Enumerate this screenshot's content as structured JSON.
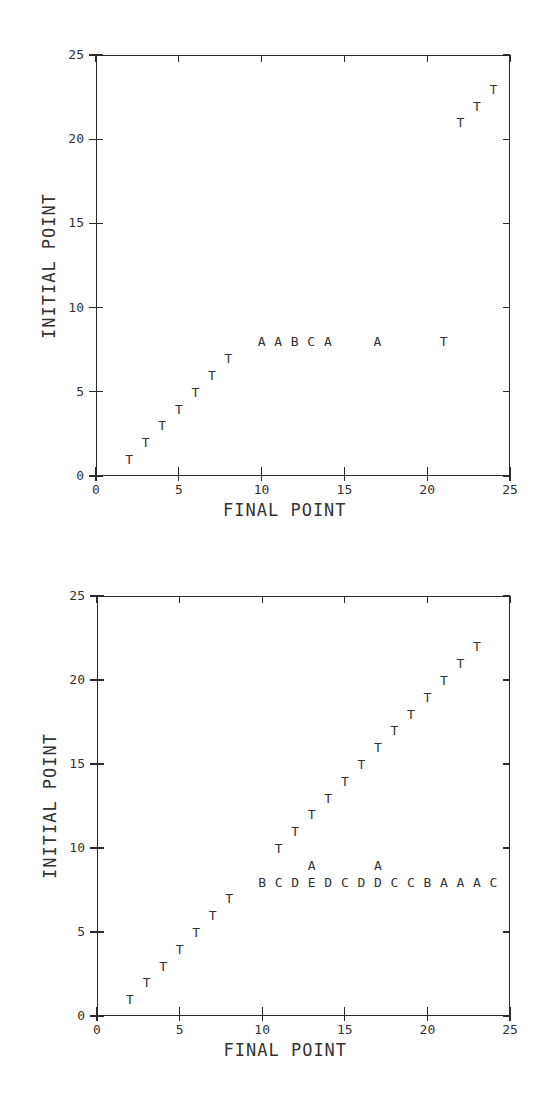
{
  "chart_data": [
    {
      "type": "scatter",
      "title": "",
      "xlabel": "FINAL POINT",
      "ylabel": "INITIAL POINT",
      "xlim": [
        0,
        25
      ],
      "ylim": [
        0,
        25
      ],
      "xticks": [
        "0",
        "5",
        "10",
        "15",
        "20",
        "25"
      ],
      "yticks": [
        "0",
        "5",
        "10",
        "15",
        "20",
        "25"
      ],
      "grid": false,
      "marker_style": "letter symbols",
      "points": [
        {
          "x": 2,
          "y": 1,
          "label": "T"
        },
        {
          "x": 3,
          "y": 2,
          "label": "T"
        },
        {
          "x": 4,
          "y": 3,
          "label": "T"
        },
        {
          "x": 5,
          "y": 4,
          "label": "T"
        },
        {
          "x": 6,
          "y": 5,
          "label": "T"
        },
        {
          "x": 7,
          "y": 6,
          "label": "T"
        },
        {
          "x": 8,
          "y": 7,
          "label": "T"
        },
        {
          "x": 10,
          "y": 8,
          "label": "A"
        },
        {
          "x": 11,
          "y": 8,
          "label": "A"
        },
        {
          "x": 12,
          "y": 8,
          "label": "B"
        },
        {
          "x": 13,
          "y": 8,
          "label": "C"
        },
        {
          "x": 14,
          "y": 8,
          "label": "A"
        },
        {
          "x": 17,
          "y": 8,
          "label": "A"
        },
        {
          "x": 21,
          "y": 8,
          "label": "T"
        },
        {
          "x": 22,
          "y": 21,
          "label": "T"
        },
        {
          "x": 23,
          "y": 22,
          "label": "T"
        },
        {
          "x": 24,
          "y": 23,
          "label": "T"
        }
      ]
    },
    {
      "type": "scatter",
      "title": "",
      "xlabel": "FINAL POINT",
      "ylabel": "INITIAL POINT",
      "xlim": [
        0,
        25
      ],
      "ylim": [
        0,
        25
      ],
      "xticks": [
        "0",
        "5",
        "10",
        "15",
        "20",
        "25"
      ],
      "yticks": [
        "0",
        "5",
        "10",
        "15",
        "20",
        "25"
      ],
      "grid": false,
      "marker_style": "letter symbols",
      "points": [
        {
          "x": 2,
          "y": 1,
          "label": "T"
        },
        {
          "x": 3,
          "y": 2,
          "label": "T"
        },
        {
          "x": 4,
          "y": 3,
          "label": "T"
        },
        {
          "x": 5,
          "y": 4,
          "label": "T"
        },
        {
          "x": 6,
          "y": 5,
          "label": "T"
        },
        {
          "x": 7,
          "y": 6,
          "label": "T"
        },
        {
          "x": 8,
          "y": 7,
          "label": "T"
        },
        {
          "x": 10,
          "y": 8,
          "label": "B"
        },
        {
          "x": 11,
          "y": 8,
          "label": "C"
        },
        {
          "x": 12,
          "y": 8,
          "label": "D"
        },
        {
          "x": 13,
          "y": 8,
          "label": "E"
        },
        {
          "x": 13,
          "y": 9,
          "label": "A"
        },
        {
          "x": 14,
          "y": 8,
          "label": "D"
        },
        {
          "x": 15,
          "y": 8,
          "label": "C"
        },
        {
          "x": 16,
          "y": 8,
          "label": "D"
        },
        {
          "x": 17,
          "y": 8,
          "label": "D"
        },
        {
          "x": 17,
          "y": 9,
          "label": "A"
        },
        {
          "x": 18,
          "y": 8,
          "label": "C"
        },
        {
          "x": 19,
          "y": 8,
          "label": "C"
        },
        {
          "x": 20,
          "y": 8,
          "label": "B"
        },
        {
          "x": 21,
          "y": 8,
          "label": "A"
        },
        {
          "x": 22,
          "y": 8,
          "label": "A"
        },
        {
          "x": 23,
          "y": 8,
          "label": "A"
        },
        {
          "x": 24,
          "y": 8,
          "label": "C"
        },
        {
          "x": 11,
          "y": 10,
          "label": "T"
        },
        {
          "x": 12,
          "y": 11,
          "label": "T"
        },
        {
          "x": 13,
          "y": 12,
          "label": "T"
        },
        {
          "x": 14,
          "y": 13,
          "label": "T"
        },
        {
          "x": 15,
          "y": 14,
          "label": "T"
        },
        {
          "x": 16,
          "y": 15,
          "label": "T"
        },
        {
          "x": 17,
          "y": 16,
          "label": "T"
        },
        {
          "x": 18,
          "y": 17,
          "label": "T"
        },
        {
          "x": 19,
          "y": 18,
          "label": "T"
        },
        {
          "x": 20,
          "y": 19,
          "label": "T"
        },
        {
          "x": 21,
          "y": 20,
          "label": "T"
        },
        {
          "x": 22,
          "y": 21,
          "label": "T"
        },
        {
          "x": 23,
          "y": 22,
          "label": "T"
        }
      ]
    }
  ]
}
